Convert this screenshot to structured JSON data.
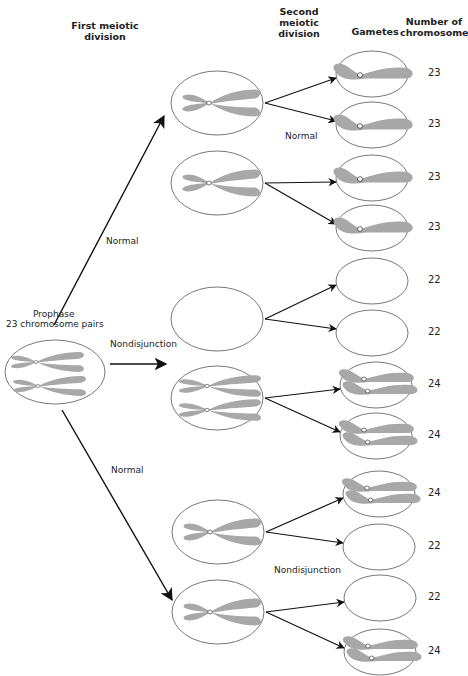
{
  "headers": {
    "first_division": "First meiotic division",
    "second_division": "Second meiotic division",
    "gametes": "Gametes",
    "number": "Number of chromosomes"
  },
  "prophase": {
    "title": "Prophase",
    "subtitle": "23 chromosome pairs"
  },
  "labels": {
    "normal_upper": "Normal",
    "nondisjunction_middle": "Nondisjunction",
    "normal_lower": "Normal",
    "normal_second": "Normal",
    "nondisjunction_second": "Nondisjunction"
  },
  "colors": {
    "chromosome": "#a8a8a8",
    "outline": "#555555",
    "arrow": "#111111"
  },
  "first_division_cells": [
    {
      "id": "cell-normal-a",
      "content": "single-dyad"
    },
    {
      "id": "cell-normal-b",
      "content": "single-dyad"
    },
    {
      "id": "cell-nd-empty",
      "content": "empty"
    },
    {
      "id": "cell-nd-double",
      "content": "double-dyad"
    },
    {
      "id": "cell-normal-c",
      "content": "single-dyad"
    },
    {
      "id": "cell-normal-d",
      "content": "single-dyad"
    }
  ],
  "gametes": [
    {
      "count": "23",
      "content": "single"
    },
    {
      "count": "23",
      "content": "single"
    },
    {
      "count": "23",
      "content": "single"
    },
    {
      "count": "23",
      "content": "single"
    },
    {
      "count": "22",
      "content": "empty"
    },
    {
      "count": "22",
      "content": "empty"
    },
    {
      "count": "24",
      "content": "double"
    },
    {
      "count": "24",
      "content": "double"
    },
    {
      "count": "24",
      "content": "double"
    },
    {
      "count": "22",
      "content": "empty"
    },
    {
      "count": "22",
      "content": "empty"
    },
    {
      "count": "24",
      "content": "double"
    }
  ]
}
